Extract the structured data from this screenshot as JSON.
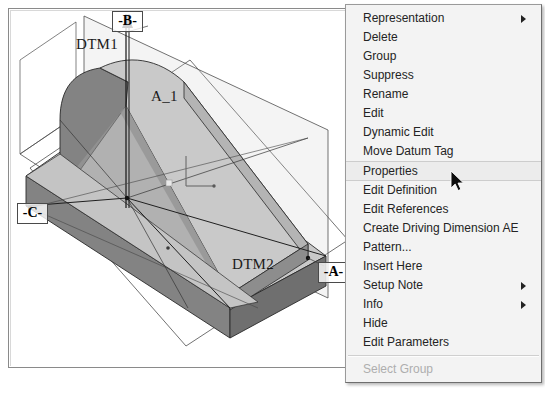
{
  "app": {
    "title": "CAD Model View with Feature Context Menu"
  },
  "model": {
    "name": "extruded-rib-bracket",
    "labels": [
      {
        "id": "dtm1",
        "text": "DTM1"
      },
      {
        "id": "dtm2",
        "text": "DTM2"
      },
      {
        "id": "axis_a1",
        "text": "A_1"
      }
    ],
    "datum_tags": [
      {
        "id": "datum_b",
        "text": "-B-"
      },
      {
        "id": "datum_c",
        "text": "-C-"
      },
      {
        "id": "datum_a",
        "text": "-A-"
      }
    ],
    "colors": {
      "face_light": "#c9c9c9",
      "face_mid": "#b4b4b4",
      "face_dark": "#838383",
      "face_darker": "#6f6f6f",
      "edge": "#2a2a2a",
      "datum_plane_edge": "#555555",
      "background": "#ffffff"
    }
  },
  "context_menu": {
    "name": "feature-context-menu",
    "background": "#f3f3f3",
    "highlight": "#ececec",
    "items": [
      {
        "label": "Representation",
        "submenu": true,
        "disabled": false,
        "selected": false
      },
      {
        "label": "Delete",
        "submenu": false,
        "disabled": false,
        "selected": false
      },
      {
        "label": "Group",
        "submenu": false,
        "disabled": false,
        "selected": false
      },
      {
        "label": "Suppress",
        "submenu": false,
        "disabled": false,
        "selected": false
      },
      {
        "label": "Rename",
        "submenu": false,
        "disabled": false,
        "selected": false
      },
      {
        "label": "Edit",
        "submenu": false,
        "disabled": false,
        "selected": false
      },
      {
        "label": "Dynamic Edit",
        "submenu": false,
        "disabled": false,
        "selected": false
      },
      {
        "label": "Move Datum Tag",
        "submenu": false,
        "disabled": false,
        "selected": false
      },
      {
        "label": "Properties",
        "submenu": false,
        "disabled": false,
        "selected": true
      },
      {
        "label": "Edit Definition",
        "submenu": false,
        "disabled": false,
        "selected": false
      },
      {
        "label": "Edit References",
        "submenu": false,
        "disabled": false,
        "selected": false
      },
      {
        "label": "Create Driving Dimension AE",
        "submenu": false,
        "disabled": false,
        "selected": false
      },
      {
        "label": "Pattern...",
        "submenu": false,
        "disabled": false,
        "selected": false
      },
      {
        "label": "Insert Here",
        "submenu": false,
        "disabled": false,
        "selected": false
      },
      {
        "label": "Setup Note",
        "submenu": true,
        "disabled": false,
        "selected": false
      },
      {
        "label": "Info",
        "submenu": true,
        "disabled": false,
        "selected": false
      },
      {
        "label": "Hide",
        "submenu": false,
        "disabled": false,
        "selected": false
      },
      {
        "label": "Edit Parameters",
        "submenu": false,
        "disabled": false,
        "selected": false
      }
    ],
    "separator_after_index": 17,
    "footer_items": [
      {
        "label": "Select Group",
        "submenu": false,
        "disabled": true,
        "selected": false
      }
    ]
  },
  "cursor": {
    "name": "arrow-pointer",
    "x": 450,
    "y": 170
  },
  "caption": ""
}
